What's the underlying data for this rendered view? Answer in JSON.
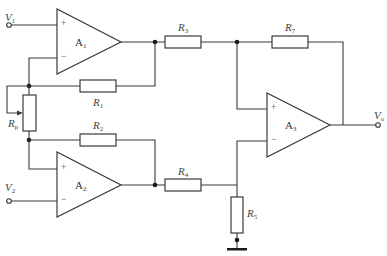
{
  "diagram": {
    "type": "instrumentation amplifier circuit",
    "inputs": [
      {
        "id": "V1",
        "label": "V",
        "sub": "1"
      },
      {
        "id": "V2",
        "label": "V",
        "sub": "2"
      }
    ],
    "output": {
      "id": "Vo",
      "label": "V",
      "sub": "o"
    },
    "amplifiers": [
      {
        "id": "A1",
        "label": "A",
        "sub": "1",
        "plus": "+",
        "minus": "−"
      },
      {
        "id": "A2",
        "label": "A",
        "sub": "2",
        "plus": "+",
        "minus": "−"
      },
      {
        "id": "A3",
        "label": "A",
        "sub": "3",
        "plus": "+",
        "minus": "−"
      }
    ],
    "resistors": [
      {
        "id": "R1",
        "label": "R",
        "sub": "1"
      },
      {
        "id": "R2",
        "label": "R",
        "sub": "2"
      },
      {
        "id": "R3",
        "label": "R",
        "sub": "3"
      },
      {
        "id": "R4",
        "label": "R",
        "sub": "4"
      },
      {
        "id": "R5",
        "label": "R",
        "sub": "5"
      },
      {
        "id": "R7",
        "label": "R",
        "sub": "7"
      },
      {
        "id": "Rp",
        "label": "R",
        "sub": "p",
        "kind": "potentiometer"
      }
    ],
    "colors": {
      "line": "#3a3a3a",
      "node": "#1a1a1a",
      "background": "#ffffff"
    }
  }
}
